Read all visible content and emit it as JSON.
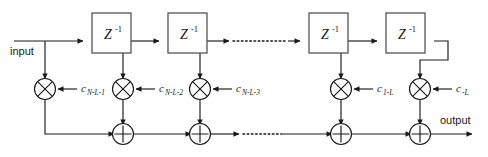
{
  "diagram": {
    "name": "fir-transversal-filter",
    "background_color": "#ffffff",
    "line_color": "#1a1a1a",
    "box_stroke_color": "#555555",
    "io_labels": {
      "input": "input",
      "output": "output"
    },
    "delay_blocks": [
      {
        "id": "z1",
        "label": "Z",
        "exponent": "-1",
        "x": 92,
        "y": 28
      },
      {
        "id": "z2",
        "label": "Z",
        "exponent": "-1",
        "x": 168,
        "y": 28
      },
      {
        "id": "z3",
        "label": "Z",
        "exponent": "-1",
        "x": 309,
        "y": 28
      },
      {
        "id": "z4",
        "label": "Z",
        "exponent": "-1",
        "x": 386,
        "y": 28
      }
    ],
    "multipliers": [
      {
        "id": "mul-1",
        "glyph": "cross",
        "cx": 45,
        "cy": 89,
        "coefficient": "c",
        "subscript": "N-L-1"
      },
      {
        "id": "mul-2",
        "glyph": "cross",
        "cx": 123,
        "cy": 89,
        "coefficient": "c",
        "subscript": "N-L-2"
      },
      {
        "id": "mul-3",
        "glyph": "cross",
        "cx": 200,
        "cy": 89,
        "coefficient": "c",
        "subscript": "N-L-3"
      },
      {
        "id": "mul-4",
        "glyph": "cross",
        "cx": 341,
        "cy": 89,
        "coefficient": "c",
        "subscript": "1-L"
      },
      {
        "id": "mul-5",
        "glyph": "cross",
        "cx": 420,
        "cy": 89,
        "coefficient": "c",
        "subscript": "-L"
      }
    ],
    "adders": [
      {
        "id": "add-1",
        "glyph": "plus",
        "cx": 123,
        "cy": 134
      },
      {
        "id": "add-2",
        "glyph": "plus",
        "cx": 200,
        "cy": 134
      },
      {
        "id": "add-3",
        "glyph": "plus",
        "cx": 341,
        "cy": 134
      },
      {
        "id": "add-4",
        "glyph": "plus",
        "cx": 420,
        "cy": 134
      }
    ],
    "ellipses": [
      {
        "id": "ellipsis-delay-line",
        "row": "delay-line",
        "x1": 233,
        "x2": 288,
        "y": 41
      },
      {
        "id": "ellipsis-adder-line",
        "row": "adder-line",
        "x1": 243,
        "x2": 283,
        "y": 134
      }
    ]
  }
}
